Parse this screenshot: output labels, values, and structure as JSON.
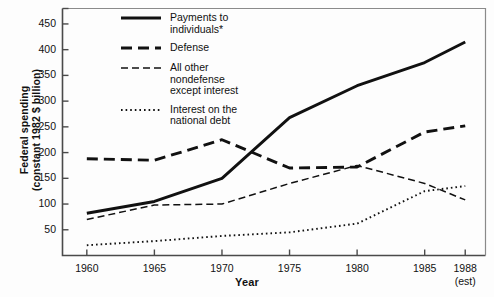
{
  "chart_data": {
    "type": "line",
    "title": "",
    "xlabel": "Year",
    "ylabel": "Federal spending\n(constant 1982 $ billion)",
    "x": [
      1960,
      1965,
      1970,
      1975,
      1980,
      1985,
      1988
    ],
    "xtick_labels": [
      "1960",
      "1965",
      "1970",
      "1975",
      "1980",
      "1985",
      "1988"
    ],
    "xtick_sublabels": [
      "",
      "",
      "",
      "",
      "",
      "",
      "(est)"
    ],
    "ytick_labels": [
      "50",
      "100",
      "150",
      "200",
      "250",
      "300",
      "350",
      "400",
      "450"
    ],
    "ytick_values": [
      50,
      100,
      150,
      200,
      250,
      300,
      350,
      400,
      450
    ],
    "ylim": [
      0,
      480
    ],
    "xlim": [
      1958.2,
      1989.5
    ],
    "grid": false,
    "legend_position": "top-left-inside",
    "series": [
      {
        "name": "Payments to\nindividuals*",
        "style": "solid",
        "values": [
          82,
          105,
          150,
          268,
          330,
          375,
          415
        ]
      },
      {
        "name": "Defense",
        "style": "long-dash",
        "values": [
          188,
          185,
          225,
          170,
          172,
          240,
          252
        ]
      },
      {
        "name": "All other\nnondefense\nexcept interest",
        "style": "short-dash",
        "values": [
          70,
          98,
          100,
          140,
          175,
          140,
          108
        ]
      },
      {
        "name": "Interest on the\nnational debt",
        "style": "dotted",
        "values": [
          20,
          28,
          38,
          45,
          62,
          125,
          135
        ]
      }
    ]
  },
  "axes": {
    "ylabel": "Federal spending\n(constant 1982 $ billion)",
    "xlabel": "Year"
  },
  "legend": {
    "items": [
      {
        "label": "Payments to\nindividuals*",
        "style": "solid"
      },
      {
        "label": "Defense",
        "style": "long-dash"
      },
      {
        "label": "All other\nnondefense\nexcept interest",
        "style": "short-dash"
      },
      {
        "label": "Interest on the\nnational debt",
        "style": "dotted"
      }
    ]
  },
  "colors": {
    "ink": "#111111",
    "axis": "#555555",
    "background": "#ffffff"
  }
}
